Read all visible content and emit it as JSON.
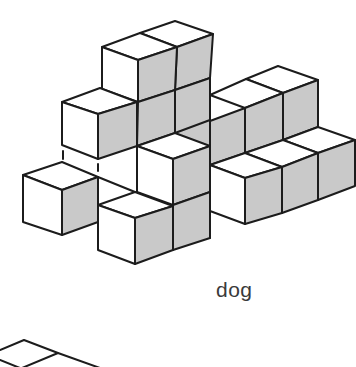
{
  "figure": {
    "label": "dog",
    "colors": {
      "top_face": "#ffffff",
      "left_face": "#ffffff",
      "right_face": "#c9c9c9",
      "edge": "#1c1c1c"
    }
  },
  "partial_figure": {
    "description": "Top of next cube structure, cropped at bottom edge"
  }
}
